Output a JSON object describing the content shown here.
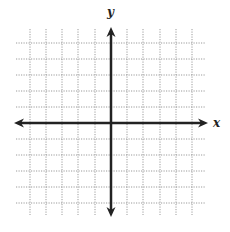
{
  "diagram": {
    "type": "coordinate-plane",
    "x_axis_label": "x",
    "y_axis_label": "y",
    "grid": {
      "vertical_lines": [
        30,
        46,
        62,
        78,
        95,
        127,
        143,
        160,
        176,
        192
      ],
      "horizontal_lines": [
        43,
        59,
        75,
        91,
        107,
        139,
        155,
        171,
        187,
        203
      ],
      "extent": {
        "left": 14,
        "right": 208,
        "top": 27,
        "bottom": 217
      },
      "line_color": "#9a9a9a",
      "style": "dotted"
    },
    "axes": {
      "origin": {
        "x": 111,
        "y": 123
      },
      "x_range": [
        14,
        208
      ],
      "y_range": [
        27,
        217
      ],
      "color": "#222222",
      "width": 2.5
    }
  }
}
